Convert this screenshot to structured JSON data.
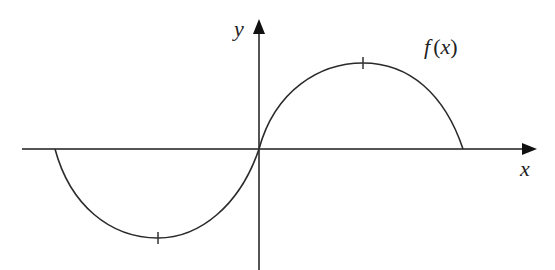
{
  "diagram": {
    "type": "function-graph",
    "axes": {
      "x_label": "x",
      "y_label": "y"
    },
    "curve_label": "f(x)",
    "curve_label_parts": {
      "name": "f",
      "open": "(",
      "var": "x",
      "close": ")"
    },
    "colors": {
      "axis": "#555555",
      "curve": "#2a2a2a",
      "text": "#222222"
    },
    "features": {
      "left_root": "x < 0",
      "minimum": "marked with tick, x < 0",
      "origin": "curve passes through origin",
      "maximum": "marked with tick, x > 0",
      "right_root": "x > 0"
    }
  }
}
